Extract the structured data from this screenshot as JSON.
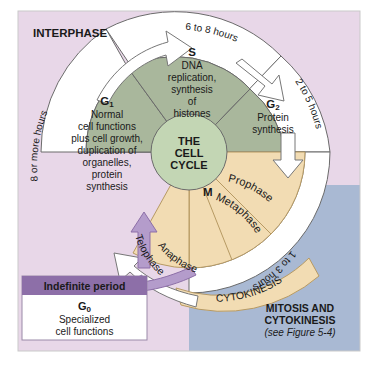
{
  "figure": {
    "interphase_label": "INTERPHASE",
    "center": {
      "line1": "THE",
      "line2": "CELL",
      "line3": "CYCLE"
    },
    "mitosis_label": {
      "line1": "MITOSIS AND",
      "line2": "CYTOKINESIS",
      "reference": "(see Figure 5-4)"
    },
    "cytokinesis_label": "CYTOKINESIS",
    "m_label": "M"
  },
  "phases": {
    "g1": {
      "name": "G",
      "sub": "1",
      "duration": "8 or more hours",
      "lines": [
        "Normal",
        "cell functions",
        "plus cell growth,",
        "duplication of",
        "organelles,",
        "protein",
        "synthesis"
      ]
    },
    "s": {
      "name": "S",
      "duration": "6 to 8 hours",
      "lines": [
        "DNA",
        "replication,",
        "synthesis",
        "of",
        "histones"
      ]
    },
    "g2": {
      "name": "G",
      "sub": "2",
      "duration": "2 to 5 hours",
      "lines": [
        "Protein",
        "synthesis"
      ]
    },
    "m": {
      "duration": "1 to 3 hours",
      "stages": [
        "Prophase",
        "Metaphase",
        "Anaphase",
        "Telophase"
      ]
    },
    "g0": {
      "header": "Indefinite period",
      "name": "G",
      "sub": "0",
      "lines": [
        "Specialized",
        "cell functions"
      ]
    }
  },
  "colors": {
    "background_pink": "#e8d7e8",
    "background_blue": "#a9b9d3",
    "interphase_wedge": "#a9b79c",
    "center_circle": "#c3d6b4",
    "mitosis_wedge": "#f2dcb3",
    "g0_header": "#8d6fa8",
    "arrow_purple": "#b49ccb",
    "arrow_white": "#ffffff",
    "stroke": "#555555"
  }
}
